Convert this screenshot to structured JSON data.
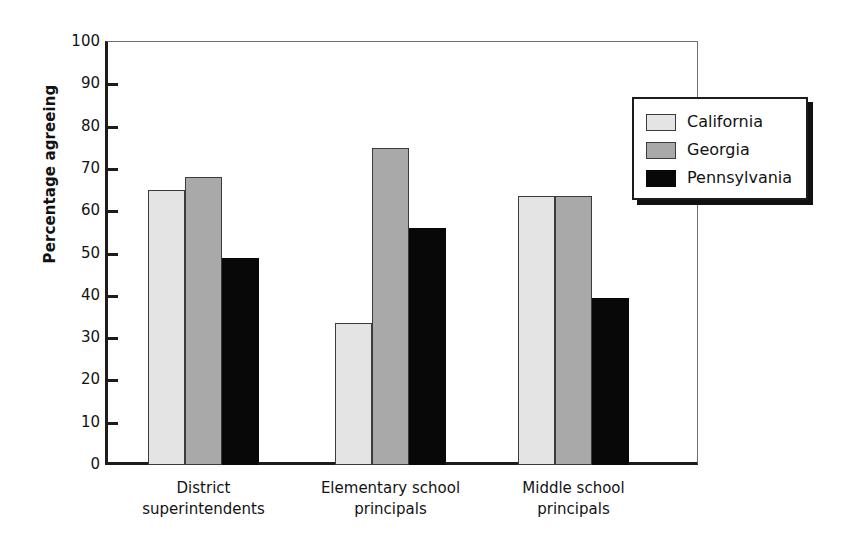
{
  "chart_data": {
    "type": "bar",
    "title": "",
    "xlabel": "",
    "ylabel": "Percentage agreeing",
    "ylim": [
      0,
      100
    ],
    "ytick_step": 10,
    "yticks": [
      100,
      90,
      80,
      70,
      60,
      50,
      40,
      30,
      20,
      10,
      0
    ],
    "grid": false,
    "legend_position": "top-right",
    "categories": [
      "District superintendents",
      "Elementary school principals",
      "Middle school principals"
    ],
    "category_lines": [
      [
        "District",
        "superintendents"
      ],
      [
        "Elementary school",
        "principals"
      ],
      [
        "Middle school",
        "principals"
      ]
    ],
    "series": [
      {
        "name": "California",
        "color": "#e4e4e4",
        "values": [
          65,
          33.5,
          63.5
        ]
      },
      {
        "name": "Georgia",
        "color": "#a9a9a9",
        "values": [
          68,
          75,
          63.5
        ]
      },
      {
        "name": "Pennsylvania",
        "color": "#080808",
        "values": [
          49,
          56,
          39.5
        ]
      }
    ]
  },
  "legend": {
    "items": [
      {
        "label": "California"
      },
      {
        "label": "Georgia"
      },
      {
        "label": "Pennsylvania"
      }
    ]
  },
  "axes": {
    "y_title": "Percentage agreeing"
  }
}
